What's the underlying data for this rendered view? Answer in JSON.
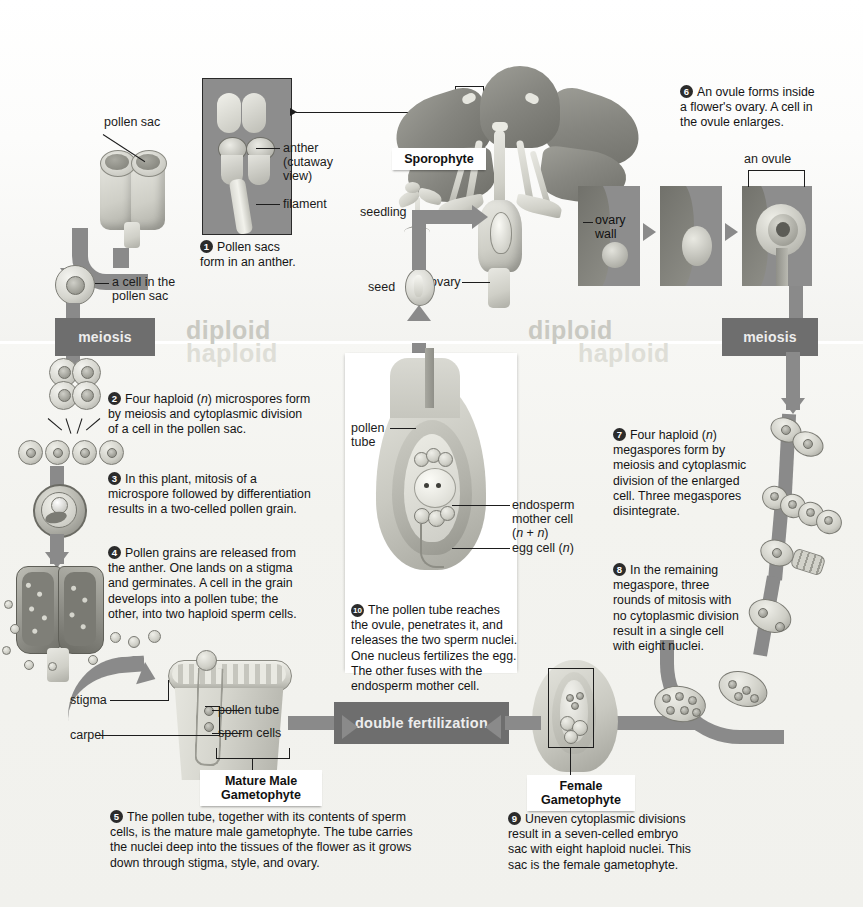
{
  "ploidy_bands": {
    "diploid_left": "diploid",
    "haploid_left": "haploid",
    "diploid_right": "diploid",
    "haploid_right": "haploid"
  },
  "process_boxes": {
    "meiosis_left": "meiosis",
    "meiosis_right": "meiosis",
    "double_fertilization": "double fertilization"
  },
  "callouts": {
    "sporophyte": "Sporophyte",
    "mature_male_gametophyte": "Mature Male\nGametophyte",
    "mature_male_gametophyte_line1": "Mature Male",
    "mature_male_gametophyte_line2": "Gametophyte",
    "female_gametophyte_line1": "Female",
    "female_gametophyte_line2": "Gametophyte"
  },
  "labels": {
    "pollen_sac": "pollen sac",
    "anther_cutaway_l1": "anther",
    "anther_cutaway_l2": "(cutaway",
    "anther_cutaway_l3": "view)",
    "filament": "filament",
    "a_cell_in_the_l1": "a cell in the",
    "a_cell_in_the_l2": "pollen sac",
    "seedling": "seedling",
    "seed": "seed",
    "ovary": "ovary",
    "ovary_wall_l1": "ovary",
    "ovary_wall_l2": "wall",
    "an_ovule": "an ovule",
    "pollen_tube_center_l1": "pollen",
    "pollen_tube_center_l2": "tube",
    "endosperm_l1": "endosperm",
    "endosperm_l2": "mother cell",
    "endosperm_l3": "(n + n)",
    "egg_cell": "egg cell (n)",
    "stigma": "stigma",
    "carpel": "carpel",
    "pollen_tube_bottom": "pollen tube",
    "sperm_cells": "sperm cells"
  },
  "steps": [
    {
      "number": "1",
      "lines": [
        "Pollen sacs",
        "form in an anther."
      ]
    },
    {
      "number": "2",
      "lines": [
        "Four haploid (n) microspores form",
        "by meiosis and cytoplasmic division",
        "of a cell in the pollen sac."
      ]
    },
    {
      "number": "3",
      "lines": [
        "In this plant, mitosis of a",
        "microspore followed by differentiation",
        "results in a two-celled pollen grain."
      ]
    },
    {
      "number": "4",
      "lines": [
        "Pollen grains are released from",
        "the anther. One lands on a stigma",
        "and germinates. A cell in the grain",
        "develops into a pollen tube; the",
        "other, into two haploid sperm cells."
      ]
    },
    {
      "number": "5",
      "lines": [
        "The pollen tube, together with its contents of sperm",
        "cells, is the mature male gametophyte. The tube carries",
        "the nuclei deep into the tissues of the flower as it grows",
        "down through stigma, style, and ovary."
      ]
    },
    {
      "number": "6",
      "lines": [
        "An ovule forms inside",
        "a flower's ovary. A cell in",
        "the ovule enlarges."
      ]
    },
    {
      "number": "7",
      "lines": [
        "Four haploid (n)",
        "megaspores form by",
        "meiosis and cytoplasmic",
        "division of the enlarged",
        "cell. Three megaspores",
        "disintegrate."
      ]
    },
    {
      "number": "8",
      "lines": [
        "In the remaining",
        "megaspore, three",
        "rounds of mitosis with",
        "no cytoplasmic division",
        "result in a single cell",
        "with eight nuclei."
      ]
    },
    {
      "number": "9",
      "lines": [
        "Uneven cytoplasmic divisions",
        "result in a seven-celled embryo",
        "sac with eight haploid nuclei. This",
        "sac is the female gametophyte."
      ]
    },
    {
      "number": "10",
      "lines": [
        "The pollen tube reaches",
        "the ovule, penetrates it, and",
        "releases the two sperm nuclei.",
        "One nucleus fertilizes the egg.",
        "The other fuses with the",
        "endosperm mother cell."
      ]
    }
  ],
  "colors": {
    "process_box": "#6e6e6e",
    "arrow": "#8a8a8a",
    "plate_background": "#8d8d8d",
    "diploid_text": "#c9c9c2",
    "haploid_text": "#dedeD7",
    "body_text": "#141414",
    "page_background": "#ffffff"
  }
}
